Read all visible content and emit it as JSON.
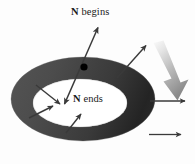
{
  "figure": {
    "name": "surface-normal-orientation-diagram",
    "background_color": "#fdfdfd",
    "width": 195,
    "height": 164
  },
  "labels": {
    "n_begins": {
      "symbol": "N",
      "text": " begins"
    },
    "n_ends": {
      "symbol": "N",
      "text": " ends"
    }
  },
  "colors": {
    "band_light": "#4f4f4f",
    "band_dark": "#262626",
    "band_mid": "#3d3d3d",
    "interior": "#ffffff",
    "arrow_thin": "#3a3a3a",
    "dot": "#000000",
    "big_arrow_start": "#f2f2f2",
    "big_arrow_end": "#8a8a8a",
    "text": "#1a1a1a"
  },
  "shapes": {
    "annulus": {
      "type": "ring-in-perspective",
      "outer_cx": 83,
      "outer_cy": 99,
      "outer_rx": 72,
      "outer_ry": 42,
      "inner_cx": 80,
      "inner_cy": 103,
      "inner_rx": 47,
      "inner_ry": 24
    },
    "dot": {
      "cx": 84,
      "cy": 67,
      "r": 3.4
    }
  },
  "vectors": {
    "normal_main": {
      "name": "double-headed-normal-vector",
      "x1": 64,
      "y1": 104,
      "x2": 98,
      "y2": 27,
      "double_headed": true
    },
    "outward": [
      {
        "x1": 118,
        "y1": 77,
        "x2": 146,
        "y2": 45
      },
      {
        "x1": 150,
        "y1": 101,
        "x2": 184,
        "y2": 101
      },
      {
        "x1": 149,
        "y1": 134,
        "x2": 180,
        "y2": 134
      }
    ],
    "inward": [
      {
        "x1": 37,
        "y1": 86,
        "x2": 59,
        "y2": 104
      },
      {
        "x1": 30,
        "y1": 117,
        "x2": 52,
        "y2": 106
      },
      {
        "x1": 67,
        "y1": 132,
        "x2": 80,
        "y2": 114
      }
    ],
    "big_gradient_arrow": {
      "name": "bulk-direction-arrow",
      "x1": 158,
      "y1": 46,
      "x2": 178,
      "y2": 92,
      "width": 11
    }
  }
}
